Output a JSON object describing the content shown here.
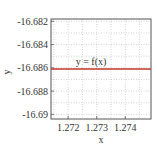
{
  "chart_data": {
    "type": "line",
    "title": "",
    "xlabel": "x",
    "ylabel": "y",
    "xlim": [
      1.2714,
      1.2749
    ],
    "ylim": [
      -16.6904,
      -16.6818
    ],
    "x_ticks": [
      1.272,
      1.273,
      1.274
    ],
    "x_tick_labels": [
      "1.272",
      "1.273",
      "1.274"
    ],
    "y_ticks": [
      -16.682,
      -16.684,
      -16.686,
      -16.688,
      -16.69
    ],
    "y_tick_labels": [
      "-16.682",
      "-16.684",
      "-16.686",
      "-16.688",
      "-16.69"
    ],
    "grid": true,
    "series": [
      {
        "name": "y = f(x)",
        "color": "#c0392b",
        "x": [
          1.2714,
          1.2749
        ],
        "y": [
          -16.6861,
          -16.6861
        ]
      }
    ],
    "annotations": [
      {
        "text": "y = f(x)",
        "x": 1.2728,
        "y": -16.6856
      }
    ],
    "legend": "none"
  }
}
